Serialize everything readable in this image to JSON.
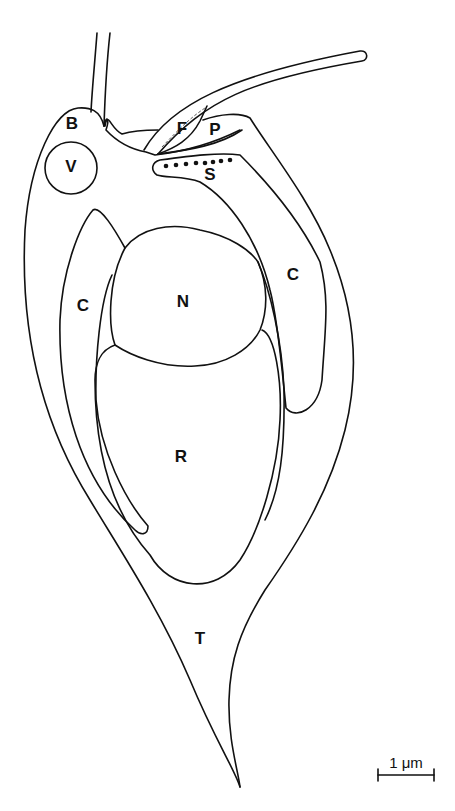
{
  "diagram": {
    "type": "cell schematic line drawing",
    "colors": {
      "line": "#111111",
      "background": "#ffffff"
    },
    "labels": [
      {
        "id": "B",
        "text": "B",
        "x": 72,
        "y": 125
      },
      {
        "id": "V",
        "text": "V",
        "x": 71,
        "y": 168
      },
      {
        "id": "F",
        "text": "F",
        "x": 182,
        "y": 130
      },
      {
        "id": "P",
        "text": "P",
        "x": 215,
        "y": 131
      },
      {
        "id": "S",
        "text": "S",
        "x": 210,
        "y": 176
      },
      {
        "id": "C-left",
        "text": "C",
        "x": 83,
        "y": 307
      },
      {
        "id": "N",
        "text": "N",
        "x": 183,
        "y": 303
      },
      {
        "id": "C-right",
        "text": "C",
        "x": 293,
        "y": 276
      },
      {
        "id": "R",
        "text": "R",
        "x": 181,
        "y": 458
      },
      {
        "id": "T",
        "text": "T",
        "x": 200,
        "y": 640
      }
    ],
    "scale_bar": {
      "label": "1 μm",
      "x1": 378,
      "x2": 434,
      "y": 775
    }
  }
}
